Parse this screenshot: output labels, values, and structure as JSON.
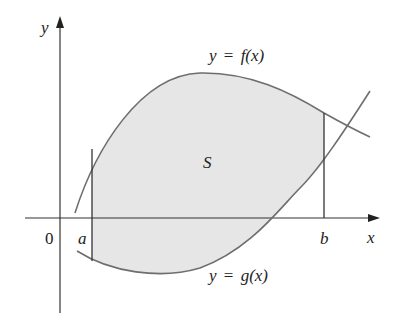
{
  "figure": {
    "axes": {
      "x_label": "x",
      "y_label": "y",
      "origin_label": "0"
    },
    "bounds": {
      "a_label": "a",
      "b_label": "b"
    },
    "region_label": "S",
    "curves": {
      "f": {
        "label_lhs": "y",
        "label_eq": "=",
        "label_rhs": "f(x)"
      },
      "g": {
        "label_lhs": "y",
        "label_eq": "=",
        "label_rhs": "g(x)"
      }
    },
    "colors": {
      "region_fill": "#e6e6e6",
      "curve_stroke": "#6e6e6e",
      "axis_stroke": "#333333",
      "text": "#222222"
    }
  }
}
